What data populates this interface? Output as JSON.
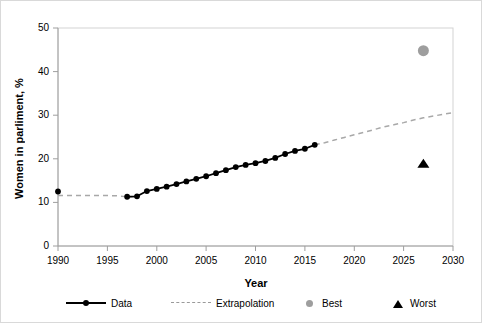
{
  "chart_data": {
    "type": "line",
    "title": "",
    "xlabel": "Year",
    "ylabel": "Women in parliment, %",
    "xlim": [
      1990,
      2030
    ],
    "ylim": [
      0,
      50
    ],
    "xticks": [
      1990,
      1995,
      2000,
      2005,
      2010,
      2015,
      2020,
      2025,
      2030
    ],
    "yticks": [
      0,
      10,
      20,
      30,
      40,
      50
    ],
    "grid": false,
    "legend_position": "bottom",
    "series": [
      {
        "name": "Data",
        "style": "solid-line-with-round-markers",
        "color": "#000000",
        "x": [
          1990,
          1997,
          1998,
          1999,
          2000,
          2001,
          2002,
          2003,
          2004,
          2005,
          2006,
          2007,
          2008,
          2009,
          2010,
          2011,
          2012,
          2013,
          2014,
          2015,
          2016
        ],
        "y": [
          12.5,
          11.3,
          11.4,
          12.6,
          13.1,
          13.6,
          14.2,
          14.8,
          15.4,
          16.0,
          16.7,
          17.4,
          18.1,
          18.6,
          19.0,
          19.5,
          20.2,
          21.1,
          21.8,
          22.3,
          23.2
        ],
        "gap_after_index": 0
      },
      {
        "name": "Extrapolation",
        "style": "dashed-line",
        "color": "#9a9a9a",
        "x": [
          1990,
          1991,
          1992,
          1993,
          1994,
          1995,
          1996,
          1997,
          2016,
          2017,
          2018,
          2019,
          2020,
          2021,
          2022,
          2023,
          2024,
          2025,
          2026,
          2027,
          2028,
          2029,
          2030
        ],
        "y": [
          11.6,
          11.6,
          11.6,
          11.6,
          11.6,
          11.6,
          11.5,
          11.3,
          23.2,
          23.7,
          24.3,
          24.9,
          25.5,
          26.1,
          26.7,
          27.3,
          27.8,
          28.3,
          28.9,
          29.4,
          29.8,
          30.2,
          30.6
        ],
        "segments": [
          [
            0,
            7
          ],
          [
            8,
            22
          ]
        ]
      },
      {
        "name": "Best",
        "style": "gray-circle-marker",
        "color": "#9e9e9e",
        "x": [
          2027
        ],
        "y": [
          44.8
        ]
      },
      {
        "name": "Worst",
        "style": "black-triangle-marker",
        "color": "#000000",
        "x": [
          2027
        ],
        "y": [
          19.0
        ]
      }
    ],
    "legend": [
      {
        "label": "Data",
        "marker": "line-dot",
        "color": "#000000"
      },
      {
        "label": "Extrapolation",
        "marker": "dashed-line",
        "color": "#9a9a9a"
      },
      {
        "label": "Best",
        "marker": "circle",
        "color": "#9e9e9e"
      },
      {
        "label": "Worst",
        "marker": "triangle",
        "color": "#000000"
      }
    ]
  },
  "axes": {
    "y_title": "Women in parliment, %",
    "x_title": "Year",
    "y_tick_labels": [
      "50",
      "40",
      "30",
      "20",
      "10",
      "0"
    ],
    "x_tick_labels": [
      "1990",
      "1995",
      "2000",
      "2005",
      "2010",
      "2015",
      "2020",
      "2025",
      "2030"
    ]
  },
  "legend": {
    "data_label": "Data",
    "extrapolation_label": "Extrapolation",
    "best_label": "Best",
    "worst_label": "Worst"
  },
  "colors": {
    "data": "#000000",
    "extrapolation": "#9a9a9a",
    "best": "#9e9e9e",
    "worst": "#000000",
    "axis": "#a6a6a6",
    "frame": "#d0d0d0",
    "border": "#d9d9d9"
  }
}
